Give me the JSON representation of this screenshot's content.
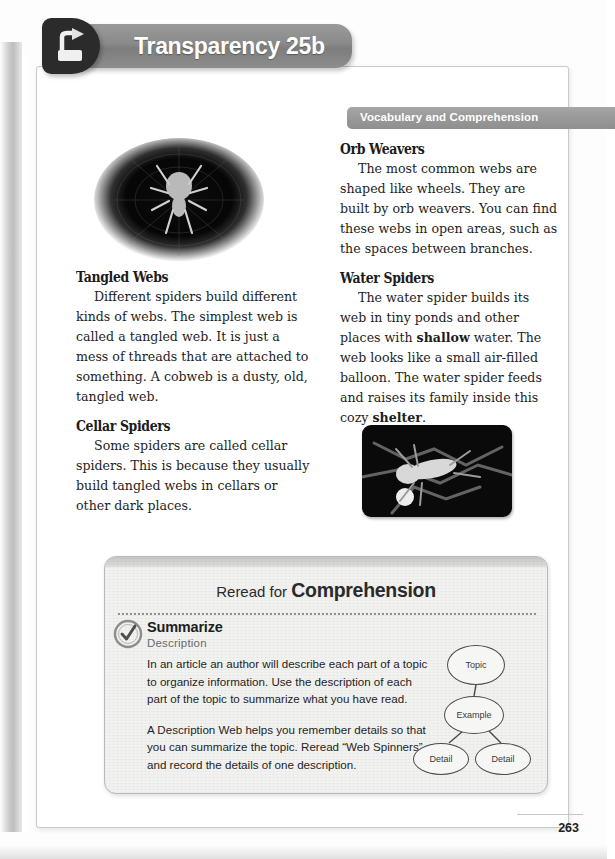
{
  "banner": {
    "title": "Transparency 25b",
    "icon": "overhead-projector-icon"
  },
  "vocabulary_ribbon": {
    "label": "Vocabulary and Comprehension"
  },
  "article": {
    "left_column": [
      {
        "heading": "Tangled Webs",
        "body": "Different spiders build different kinds of webs. The simplest web is called a tangled web. It is just a mess of threads that are attached to something. A cobweb is a dusty, old, tangled web."
      },
      {
        "heading": "Cellar Spiders",
        "body": "Some spiders are called cellar spiders. This is because they usually build tangled webs in cellars or other dark places."
      }
    ],
    "right_column": [
      {
        "heading": "Orb Weavers",
        "body": "The most common webs are shaped like wheels. They are built by orb weavers. You can find these webs in open areas, such as the spaces between branches."
      },
      {
        "heading": "Water Spiders",
        "body_part1": "The water spider builds its web in tiny ponds and other places with ",
        "bold1": "shallow",
        "body_part2": " water. The web looks like a small air-filled balloon. The water spider feeds and raises its family inside this cozy ",
        "bold2": "shelter",
        "body_part3": "."
      }
    ]
  },
  "photos": {
    "spider_web_photo": "orb-weaver-spider-on-web-photo",
    "water_spider_photo": "water-spider-photo"
  },
  "comprehension": {
    "title_light": "Reread for",
    "title_bold": "Comprehension",
    "badge": "strategy-check-badge-icon",
    "strategy": "Summarize",
    "skill": "Description",
    "paragraph1": "In an article an author will describe each part of a topic to organize information. Use the description of each part of the topic to summarize what you have read.",
    "paragraph2": "A Description Web helps you remember details so that you can summarize the topic. Reread “Web Spinners” and record the details of one description.",
    "web_diagram": {
      "topic": "Topic",
      "example": "Example",
      "detail_left": "Detail",
      "detail_right": "Detail"
    }
  },
  "footer": {
    "page_number": "263"
  },
  "colors": {
    "banner_gray": "#8a8a8a",
    "ribbon_gray": "#999999",
    "panel_bg": "#f2f2f0",
    "text_dark": "#1d1d1d",
    "sub_gray": "#6b6b6b"
  }
}
